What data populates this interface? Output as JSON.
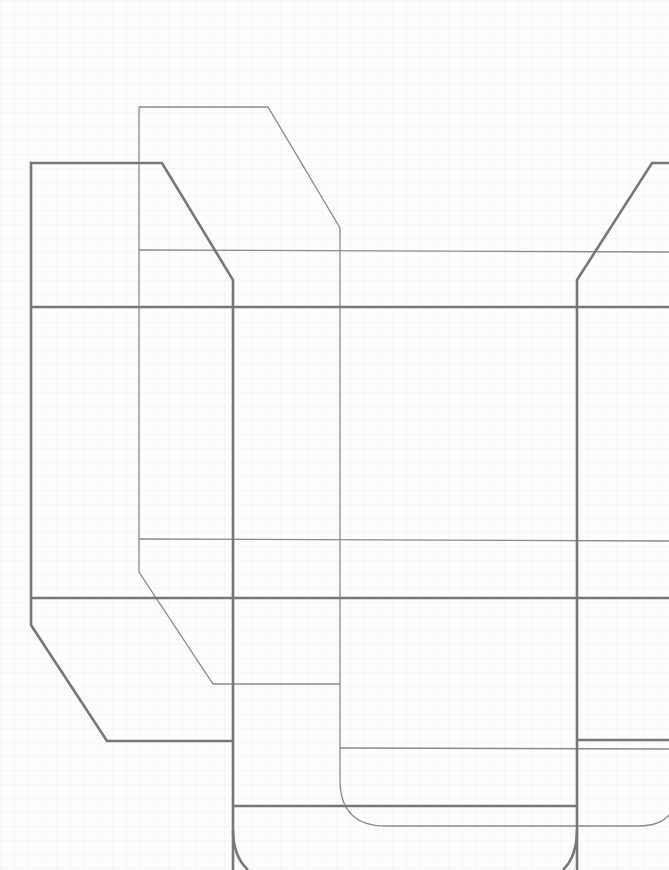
{
  "diagram": {
    "type": "box-dieline",
    "colors": {
      "stroke_heavy": "#777777",
      "stroke_light": "#8a8a8a",
      "background": "#fdfdfd"
    },
    "heavy_paths": [
      "M 233 870 L 233 280 L 162 163 L 31 163 L 31 625 L 107 741 L 233 741",
      "M 31 307 L 669 307",
      "M 31 598 L 669 598",
      "M 577 870 L 577 280 L 652 163 L 669 163",
      "M 233 806 L 577 806",
      "M 577 740 L 669 740",
      "M 233 830 Q 233 856 248 870",
      "M 577 830 Q 577 856 563 870"
    ],
    "light_paths": [
      "M 139 107 L 268 107 L 340 228 L 340 780 Q 340 826 386 826 L 638 826 Q 660 826 669 815",
      "M 139 107 L 139 572 L 213 684 L 340 684",
      "M 139 250 L 669 252",
      "M 139 539 L 669 541",
      "M 340 748 L 669 749"
    ]
  }
}
